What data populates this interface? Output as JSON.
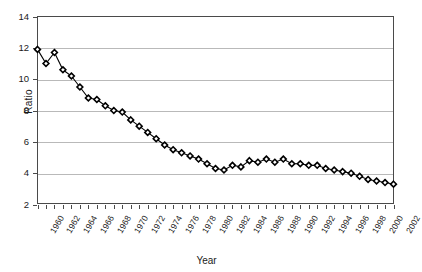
{
  "chart_data": {
    "type": "line",
    "title": "",
    "xlabel": "Year",
    "ylabel": "Ratio",
    "ylim": [
      2,
      14
    ],
    "ytick_step": 2,
    "yticks": [
      2,
      4,
      6,
      8,
      10,
      12,
      14
    ],
    "xlim": [
      1960,
      2002
    ],
    "xtick_step": 2,
    "xticks": [
      1960,
      1962,
      1964,
      1966,
      1968,
      1970,
      1972,
      1974,
      1976,
      1978,
      1980,
      1982,
      1984,
      1986,
      1988,
      1990,
      1992,
      1994,
      1996,
      1998,
      2000,
      2002
    ],
    "grid": "horizontal",
    "legend": "none",
    "marker": "diamond",
    "marker_fill": "#ffffff",
    "marker_edge": "#000000",
    "line_color": "#000000",
    "x": [
      1960,
      1961,
      1962,
      1963,
      1964,
      1965,
      1966,
      1967,
      1968,
      1969,
      1970,
      1971,
      1972,
      1973,
      1974,
      1975,
      1976,
      1977,
      1978,
      1979,
      1980,
      1981,
      1982,
      1983,
      1984,
      1985,
      1986,
      1987,
      1988,
      1989,
      1990,
      1991,
      1992,
      1993,
      1994,
      1995,
      1996,
      1997,
      1998,
      1999,
      2000,
      2001,
      2002
    ],
    "values": [
      11.9,
      11.0,
      11.7,
      10.6,
      10.2,
      9.5,
      8.8,
      8.7,
      8.3,
      8.0,
      7.9,
      7.4,
      7.0,
      6.6,
      6.2,
      5.8,
      5.5,
      5.3,
      5.1,
      4.9,
      4.6,
      4.3,
      4.2,
      4.5,
      4.4,
      4.8,
      4.7,
      4.9,
      4.7,
      4.9,
      4.6,
      4.6,
      4.5,
      4.5,
      4.3,
      4.2,
      4.1,
      4.0,
      3.8,
      3.6,
      3.5,
      3.4,
      3.3
    ],
    "series_name": "Ratio"
  },
  "axes": {
    "y_title": "Ratio",
    "x_title": "Year"
  }
}
